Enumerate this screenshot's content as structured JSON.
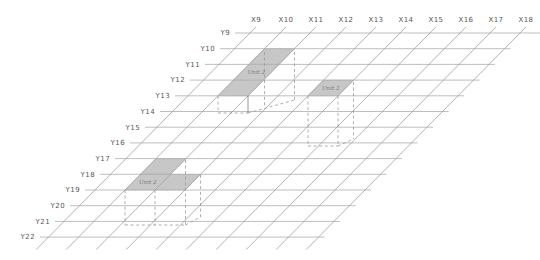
{
  "diagram": {
    "background": "#ffffff",
    "x_axis": {
      "labels": [
        "X9",
        "X10",
        "X11",
        "X12",
        "X13",
        "X14",
        "X15",
        "X16",
        "X17",
        "X18"
      ]
    },
    "y_axis": {
      "labels": [
        "Y9",
        "Y10",
        "Y11",
        "Y12",
        "Y13",
        "Y14",
        "Y15",
        "Y16",
        "Y17",
        "Y18",
        "Y19",
        "Y20",
        "Y21",
        "Y22"
      ]
    },
    "colors": {
      "row_line": "#adadad",
      "column_line": "#9f9f9f",
      "region_fill": "#c7c7c7",
      "region_edge": "#b2b2b2",
      "dash_line": "#9a9a9a",
      "solid_drop_line": "#7c7c7c",
      "axis_text": "#575757",
      "region_text": "#7d7d7d"
    },
    "regions": [
      {
        "id": "region-1",
        "label": "Unit 2",
        "cells": [
          {
            "col_start": "X10",
            "col_end": "X11",
            "row_start": "Y10",
            "row_end": "Y13"
          }
        ],
        "label_anchor": {
          "col": 10.5,
          "row": 11.5
        },
        "projection_segments": [
          {
            "x1": 218,
            "y1": 96,
            "x2": 218,
            "y2": 113,
            "style": "dashed"
          },
          {
            "x1": 248,
            "y1": 96,
            "x2": 248,
            "y2": 113,
            "style": "solid"
          },
          {
            "x1": 218,
            "y1": 113,
            "x2": 248,
            "y2": 113,
            "style": "dashed"
          },
          {
            "x1": 264.5,
            "y1": 52,
            "x2": 264.5,
            "y2": 107,
            "style": "dashed"
          },
          {
            "x1": 294.5,
            "y1": 52,
            "x2": 294.5,
            "y2": 100,
            "style": "dashed"
          },
          {
            "x1": 248,
            "y1": 113,
            "x2": 294.5,
            "y2": 100,
            "style": "dashed"
          }
        ]
      },
      {
        "id": "region-2",
        "label": "Unit 2",
        "cells": [
          {
            "col_start": "X13",
            "col_end": "X14",
            "row_start": "Y12",
            "row_end": "Y13"
          }
        ],
        "label_anchor": {
          "col": 13.5,
          "row": 12.5
        },
        "projection_segments": [
          {
            "x1": 308,
            "y1": 96,
            "x2": 308,
            "y2": 146,
            "style": "dashed"
          },
          {
            "x1": 338,
            "y1": 96,
            "x2": 338,
            "y2": 146,
            "style": "dashed"
          },
          {
            "x1": 353.5,
            "y1": 82,
            "x2": 353.5,
            "y2": 139,
            "style": "dashed"
          },
          {
            "x1": 308,
            "y1": 146,
            "x2": 338,
            "y2": 146,
            "style": "dashed"
          },
          {
            "x1": 338,
            "y1": 146,
            "x2": 353.5,
            "y2": 139,
            "style": "dashed"
          }
        ]
      },
      {
        "id": "region-3",
        "label": "Unit 2",
        "cells": [
          {
            "col_start": "X10",
            "col_end": "X11",
            "row_start": "Y17",
            "row_end": "Y18"
          },
          {
            "col_start": "X10",
            "col_end": "X12",
            "row_start": "Y18",
            "row_end": "Y19"
          }
        ],
        "label_anchor": {
          "col": 10.5,
          "row": 18.5
        },
        "projection_segments": [
          {
            "x1": 125,
            "y1": 190,
            "x2": 125,
            "y2": 225,
            "style": "dashed"
          },
          {
            "x1": 155,
            "y1": 190,
            "x2": 155,
            "y2": 225,
            "style": "dashed"
          },
          {
            "x1": 185.5,
            "y1": 160,
            "x2": 185.5,
            "y2": 225,
            "style": "dashed"
          },
          {
            "x1": 200.5,
            "y1": 175,
            "x2": 200.5,
            "y2": 217,
            "style": "dashed"
          },
          {
            "x1": 125,
            "y1": 225,
            "x2": 185.5,
            "y2": 225,
            "style": "dashed"
          },
          {
            "x1": 185.5,
            "y1": 225,
            "x2": 200.5,
            "y2": 217,
            "style": "dashed"
          }
        ]
      }
    ]
  }
}
